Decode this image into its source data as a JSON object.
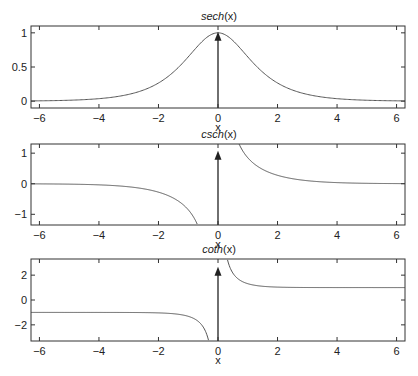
{
  "figure": {
    "width": 418,
    "height": 376
  },
  "chart_data": [
    {
      "type": "line",
      "title": "sech(x)",
      "title_func": "sech",
      "title_arg": "(x)",
      "xlabel": "x",
      "ylabel": "",
      "xlim": [
        -6.2832,
        6.2832
      ],
      "ylim": [
        -0.1,
        1.1
      ],
      "xticks": [
        -6,
        -4,
        -2,
        0,
        2,
        4,
        6
      ],
      "xtick_labels": [
        "−6",
        "−4",
        "−2",
        "0",
        "2",
        "4",
        "6"
      ],
      "yticks": [
        0,
        0.5,
        1
      ],
      "ytick_labels": [
        "0",
        "0.5",
        "1"
      ],
      "grid": false,
      "box": {
        "left": 31,
        "right": 405,
        "top": 26,
        "bottom": 108
      },
      "series": [
        {
          "name": "sech(x)",
          "function": "sech",
          "x": [
            -6.28,
            -5,
            -4,
            -3,
            -2.5,
            -2,
            -1.5,
            -1,
            -0.5,
            0,
            0.5,
            1,
            1.5,
            2,
            2.5,
            3,
            4,
            5,
            6.28
          ],
          "y": [
            0.004,
            0.013,
            0.037,
            0.099,
            0.163,
            0.266,
            0.425,
            0.648,
            0.887,
            1.0,
            0.887,
            0.648,
            0.425,
            0.266,
            0.163,
            0.099,
            0.037,
            0.013,
            0.004
          ]
        }
      ],
      "annotations": [
        {
          "type": "impulse-arrow",
          "x": 0,
          "y_from": -0.1,
          "y_to": 1.0,
          "label": "delta at x=0"
        }
      ]
    },
    {
      "type": "line",
      "title": "csch(x)",
      "title_func": "csch",
      "title_arg": "(x)",
      "xlabel": "x",
      "ylabel": "",
      "xlim": [
        -6.2832,
        6.2832
      ],
      "ylim": [
        -1.35,
        1.3
      ],
      "xticks": [
        -6,
        -4,
        -2,
        0,
        2,
        4,
        6
      ],
      "xtick_labels": [
        "−6",
        "−4",
        "−2",
        "0",
        "2",
        "4",
        "6"
      ],
      "yticks": [
        -1,
        0,
        1
      ],
      "ytick_labels": [
        "−1",
        "0",
        "1"
      ],
      "grid": false,
      "box": {
        "left": 31,
        "right": 405,
        "top": 144,
        "bottom": 225
      },
      "series": [
        {
          "name": "csch(x), x<0",
          "function": "csch",
          "x": [
            -6.28,
            -5,
            -4,
            -3,
            -2.5,
            -2,
            -1.5,
            -1.2,
            -1,
            -0.8,
            -0.7
          ],
          "y": [
            -0.004,
            -0.013,
            -0.037,
            -0.1,
            -0.166,
            -0.276,
            -0.47,
            -0.662,
            -0.851,
            -1.13,
            -1.32
          ]
        },
        {
          "name": "csch(x), x>0",
          "function": "csch",
          "x": [
            0.7,
            0.8,
            1,
            1.2,
            1.5,
            2,
            2.5,
            3,
            4,
            5,
            6.28
          ],
          "y": [
            1.32,
            1.13,
            0.851,
            0.662,
            0.47,
            0.276,
            0.166,
            0.1,
            0.037,
            0.013,
            0.004
          ]
        }
      ],
      "annotations": [
        {
          "type": "impulse-arrow",
          "x": 0,
          "y_from": -1.35,
          "y_to": 1.05,
          "label": "delta at x=0"
        }
      ]
    },
    {
      "type": "line",
      "title": "coth(x)",
      "title_func": "coth",
      "title_arg": "(x)",
      "xlabel": "x",
      "ylabel": "",
      "xlim": [
        -6.2832,
        6.2832
      ],
      "ylim": [
        -3.3,
        3.3
      ],
      "xticks": [
        -6,
        -4,
        -2,
        0,
        2,
        4,
        6
      ],
      "xtick_labels": [
        "−6",
        "−4",
        "−2",
        "0",
        "2",
        "4",
        "6"
      ],
      "yticks": [
        -2,
        0,
        2
      ],
      "ytick_labels": [
        "−2",
        "0",
        "2"
      ],
      "grid": false,
      "box": {
        "left": 31,
        "right": 405,
        "top": 259,
        "bottom": 341
      },
      "series": [
        {
          "name": "coth(x), x<0",
          "function": "coth",
          "x": [
            -6.28,
            -4,
            -3,
            -2,
            -1.5,
            -1.2,
            -1,
            -0.8,
            -0.6,
            -0.5,
            -0.4,
            -0.32
          ],
          "y": [
            -1.0,
            -1.001,
            -1.005,
            -1.037,
            -1.105,
            -1.199,
            -1.313,
            -1.506,
            -1.862,
            -2.164,
            -2.632,
            -3.23
          ]
        },
        {
          "name": "coth(x), x>0",
          "function": "coth",
          "x": [
            0.32,
            0.4,
            0.5,
            0.6,
            0.8,
            1,
            1.2,
            1.5,
            2,
            3,
            4,
            6.28
          ],
          "y": [
            3.23,
            2.632,
            2.164,
            1.862,
            1.506,
            1.313,
            1.199,
            1.105,
            1.037,
            1.005,
            1.001,
            1.0
          ]
        }
      ],
      "annotations": [
        {
          "type": "impulse-arrow",
          "x": 0,
          "y_from": -3.3,
          "y_to": 2.6,
          "label": "delta at x=0"
        }
      ]
    }
  ],
  "colors": {
    "axes": "#333333",
    "curve": "#555555",
    "impulse": "#222222",
    "background": "#ffffff"
  }
}
